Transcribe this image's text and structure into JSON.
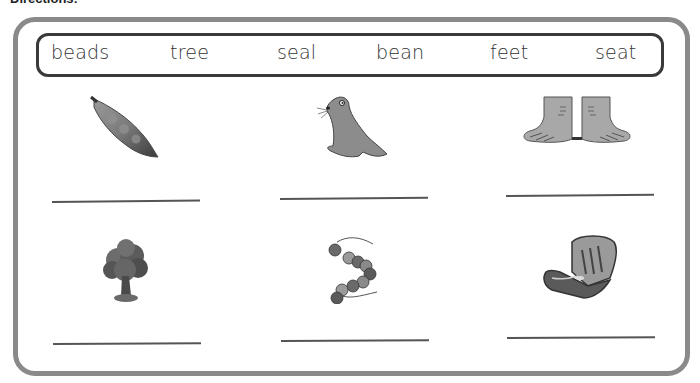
{
  "header": {
    "directions_label": "Directions:"
  },
  "word_bank": {
    "words": [
      "beads",
      "tree",
      "seal",
      "bean",
      "feet",
      "seat"
    ]
  },
  "pictures": [
    {
      "row": 1,
      "col": 1,
      "icon": "bean-pod-icon",
      "label": "bean pod"
    },
    {
      "row": 1,
      "col": 2,
      "icon": "seal-icon",
      "label": "seal"
    },
    {
      "row": 1,
      "col": 3,
      "icon": "feet-icon",
      "label": "feet"
    },
    {
      "row": 2,
      "col": 1,
      "icon": "tree-icon",
      "label": "tree"
    },
    {
      "row": 2,
      "col": 2,
      "icon": "beads-icon",
      "label": "beads"
    },
    {
      "row": 2,
      "col": 3,
      "icon": "car-seat-icon",
      "label": "seat"
    }
  ],
  "answer_lines": [
    {
      "row": 1,
      "col": 1,
      "value": ""
    },
    {
      "row": 1,
      "col": 2,
      "value": ""
    },
    {
      "row": 1,
      "col": 3,
      "value": ""
    },
    {
      "row": 2,
      "col": 1,
      "value": ""
    },
    {
      "row": 2,
      "col": 2,
      "value": ""
    },
    {
      "row": 2,
      "col": 3,
      "value": ""
    }
  ],
  "colors": {
    "outer_border": "#8a8a8a",
    "word_bank_border": "#3a3a3a",
    "text": "#333333"
  }
}
